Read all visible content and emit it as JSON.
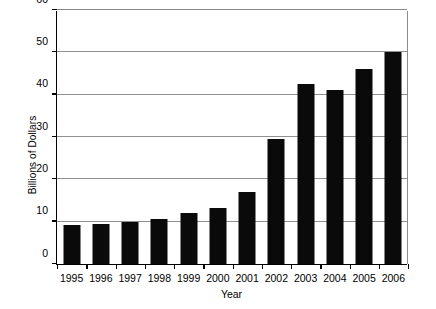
{
  "chart_data": {
    "type": "bar",
    "title": "",
    "xlabel": "Year",
    "ylabel": "Billions of Dollars",
    "categories": [
      "1995",
      "1996",
      "1997",
      "1998",
      "1999",
      "2000",
      "2001",
      "2002",
      "2003",
      "2004",
      "2005",
      "2006"
    ],
    "values": [
      9.2,
      9.5,
      10.0,
      10.7,
      12.0,
      13.3,
      17.0,
      29.5,
      42.5,
      41.0,
      46.0,
      50.0
    ],
    "ylim": [
      0,
      60
    ],
    "yticks": [
      0,
      10,
      20,
      30,
      40,
      50,
      60
    ],
    "ytick_labels": [
      "0",
      "10",
      "20",
      "30",
      "40",
      "50",
      "60"
    ],
    "grid": true,
    "grid_axis": "y",
    "legend": false,
    "bar_color": "#0a0a0a",
    "grid_color": "#909090",
    "axis_color": "#000000"
  }
}
